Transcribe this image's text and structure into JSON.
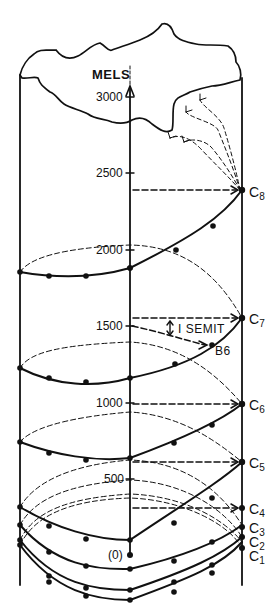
{
  "diagram": {
    "type": "pitch helix",
    "axis": {
      "title": "MELS",
      "ticks": [
        {
          "label": "3000",
          "value": 3000
        },
        {
          "label": "2500",
          "value": 2500
        },
        {
          "label": "2000",
          "value": 2000
        },
        {
          "label": "1500",
          "value": 1500
        },
        {
          "label": "1000",
          "value": 1000
        },
        {
          "label": "500",
          "value": 500
        }
      ],
      "origin_label": "(0)"
    },
    "annotation": {
      "interval_label": "I SEMIT",
      "note_label": "B6"
    },
    "octave_labels": [
      {
        "base": "C",
        "sub": "8"
      },
      {
        "base": "C",
        "sub": "7"
      },
      {
        "base": "C",
        "sub": "6"
      },
      {
        "base": "C",
        "sub": "5"
      },
      {
        "base": "C",
        "sub": "4"
      },
      {
        "base": "C",
        "sub": "3"
      },
      {
        "base": "C",
        "sub": "2"
      },
      {
        "base": "C",
        "sub": "1"
      }
    ],
    "colors": {
      "ink": "#111111",
      "background": "#ffffff"
    }
  }
}
